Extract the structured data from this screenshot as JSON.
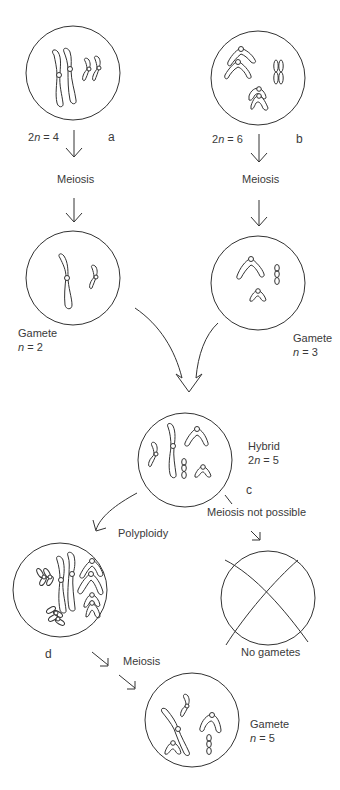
{
  "diagram": {
    "type": "biology-diagram",
    "topic": "Allopolyploidy via hybridization",
    "species_a": {
      "letter": "a",
      "ploidy_prefix": "2",
      "ploidy_var": "n",
      "ploidy_eq": " = 4"
    },
    "species_b": {
      "letter": "b",
      "ploidy_prefix": "2",
      "ploidy_var": "n",
      "ploidy_eq": " = 6"
    },
    "meiosis_a": "Meiosis",
    "meiosis_b": "Meiosis",
    "gamete_a": {
      "title": "Gamete",
      "ploidy_var": "n",
      "ploidy_eq": " = 2"
    },
    "gamete_b": {
      "title": "Gamete",
      "ploidy_var": "n",
      "ploidy_eq": " = 3"
    },
    "hybrid": {
      "title": "Hybrid",
      "ploidy_prefix": "2",
      "ploidy_var": "n",
      "ploidy_eq": " = 5",
      "letter": "c"
    },
    "meiosis_not_possible": "Meiosis not possible",
    "no_gametes": "No gametes",
    "polyploidy": "Polyploidy",
    "polyploid_letter": "d",
    "meiosis_d": "Meiosis",
    "gamete_final": {
      "title": "Gamete",
      "ploidy_var": "n",
      "ploidy_eq": " = 5"
    },
    "colors": {
      "line": "#333333",
      "text": "#3a3a3a",
      "background": "#ffffff"
    }
  }
}
